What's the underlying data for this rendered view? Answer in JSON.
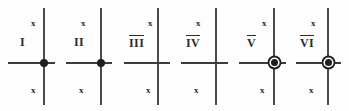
{
  "diagram": {
    "background_color": "#fdfdfd",
    "line_color": "#4a4a4a",
    "node_color": "#1e1e1e",
    "axis_label_top": "x",
    "axis_label_bottom": "x",
    "panels": [
      {
        "numeral": "I",
        "overline": false,
        "node": "solid",
        "x_top": "x",
        "x_bottom": "x",
        "panel_left": 0,
        "vline_x": 43,
        "vline_top": 8,
        "vline_bottom": 105,
        "hline_left": 8,
        "hline_right": 55,
        "hline_y": 62,
        "numeral_x": 20,
        "numeral_y": 36,
        "xtop_x": 31,
        "xtop_y": 19,
        "xbot_x": 31,
        "xbot_y": 86
      },
      {
        "numeral": "II",
        "overline": false,
        "node": "solid",
        "x_top": "x",
        "x_bottom": "x",
        "panel_left": 58,
        "vline_x": 100,
        "vline_top": 8,
        "vline_bottom": 105,
        "hline_left": 66,
        "hline_right": 112,
        "hline_y": 62,
        "numeral_x": 74,
        "numeral_y": 36,
        "xtop_x": 81,
        "xtop_y": 19,
        "xbot_x": 79,
        "xbot_y": 86
      },
      {
        "numeral": "III",
        "overline": true,
        "node": "none",
        "x_top": "x",
        "x_bottom": "x",
        "panel_left": 116,
        "vline_x": 157,
        "vline_top": 8,
        "vline_bottom": 105,
        "hline_left": 124,
        "hline_right": 170,
        "hline_y": 62,
        "numeral_x": 129,
        "numeral_y": 36,
        "xtop_x": 148,
        "xtop_y": 19,
        "xbot_x": 146,
        "xbot_y": 86
      },
      {
        "numeral": "IV",
        "overline": true,
        "node": "none",
        "x_top": "x",
        "x_bottom": "x",
        "panel_left": 174,
        "vline_x": 215,
        "vline_top": 8,
        "vline_bottom": 105,
        "hline_left": 181,
        "hline_right": 228,
        "hline_y": 62,
        "numeral_x": 186,
        "numeral_y": 36,
        "xtop_x": 196,
        "xtop_y": 19,
        "xbot_x": 194,
        "xbot_y": 86
      },
      {
        "numeral": "V",
        "overline": true,
        "node": "ringed",
        "x_top": "x",
        "x_bottom": "x",
        "panel_left": 232,
        "vline_x": 273,
        "vline_top": 8,
        "vline_bottom": 105,
        "hline_left": 239,
        "hline_right": 286,
        "hline_y": 62,
        "numeral_x": 247,
        "numeral_y": 36,
        "xtop_x": 262,
        "xtop_y": 19,
        "xbot_x": 260,
        "xbot_y": 86
      },
      {
        "numeral": "VI",
        "overline": true,
        "node": "ringed",
        "x_top": "x",
        "x_bottom": "x",
        "panel_left": 290,
        "vline_x": 327,
        "vline_top": 8,
        "vline_bottom": 105,
        "hline_left": 296,
        "hline_right": 341,
        "hline_y": 62,
        "numeral_x": 300,
        "numeral_y": 36,
        "xtop_x": 311,
        "xtop_y": 19,
        "xbot_x": 309,
        "xbot_y": 86
      }
    ]
  }
}
